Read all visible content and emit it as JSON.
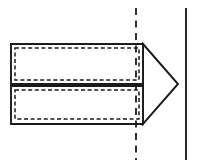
{
  "figure": {
    "background_color": "#ffffff",
    "line_color": "#1b1b1b",
    "reference_line_color": "#2a2a2a",
    "canvas": {
      "width": 198,
      "height": 167
    },
    "parts": {
      "upper_panel": {
        "label": "upper rectangular panel",
        "outline": "11,44 143,44 143,84 11,84",
        "inner_dashed": "15,48 139,48 139,80 15,80"
      },
      "lower_panel": {
        "label": "lower rectangular panel",
        "outline": "11,86 143,86 143,124 11,124",
        "inner_dashed": "15,90 139,90 139,119 15,119"
      },
      "nose_point": {
        "label": "triangular nose point",
        "outline": "143,44 178,84 143,124"
      },
      "hidden_edge": {
        "label": "hidden vertical edge behind nose",
        "path": "140,45 140,123"
      }
    },
    "annotations": {
      "center_section_line": {
        "label": "vertical dashed section line",
        "x": 136,
        "y_start": 8,
        "y_end": 160
      },
      "right_reference_line": {
        "label": "vertical solid reference line",
        "x": 186,
        "y_start": 8,
        "y_end": 160
      }
    }
  }
}
